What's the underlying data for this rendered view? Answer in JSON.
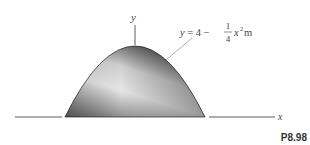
{
  "figure": {
    "label": "P8.98",
    "axes": {
      "x_label": "x",
      "y_label": "y"
    },
    "equation": {
      "lhs": "y = 4 − ",
      "frac_num": "1",
      "frac_den": "4",
      "var": "x",
      "exp": "2",
      "unit": " m"
    },
    "colors": {
      "shape_dark": "#4a4a4a",
      "shape_light": "#e8e8e8",
      "line": "#333333",
      "leader": "#999999"
    }
  }
}
